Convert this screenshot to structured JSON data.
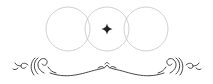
{
  "ornament": {
    "description": "Decorative divider: three overlapping thin circles with a four-pointed star at the center, above a symmetric flourish scroll",
    "colors": {
      "circle_stroke": "#c4c4c4",
      "star_fill": "#222222",
      "flourish_stroke": "#333333",
      "background": "#ffffff"
    },
    "circles": [
      {
        "cx": 68,
        "cy": 29,
        "r": 22
      },
      {
        "cx": 107,
        "cy": 29,
        "r": 22
      },
      {
        "cx": 146,
        "cy": 29,
        "r": 22
      }
    ],
    "star": {
      "cx": 107,
      "cy": 29
    }
  }
}
